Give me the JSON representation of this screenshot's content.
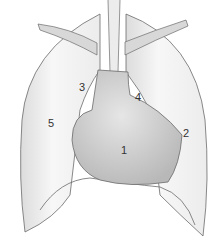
{
  "diagram": {
    "labels": [
      {
        "id": "1",
        "text": "1",
        "x": 121,
        "y": 145
      },
      {
        "id": "2",
        "text": "2",
        "x": 183,
        "y": 128
      },
      {
        "id": "3",
        "text": "3",
        "x": 79,
        "y": 82
      },
      {
        "id": "4",
        "text": "4",
        "x": 135,
        "y": 92
      },
      {
        "id": "5",
        "text": "5",
        "x": 48,
        "y": 118
      }
    ],
    "colors": {
      "lung_fill": "#f2f2f2",
      "heart_fill": "#d4d4d4",
      "outline": "#6b6b6b",
      "label": "#333333"
    }
  }
}
